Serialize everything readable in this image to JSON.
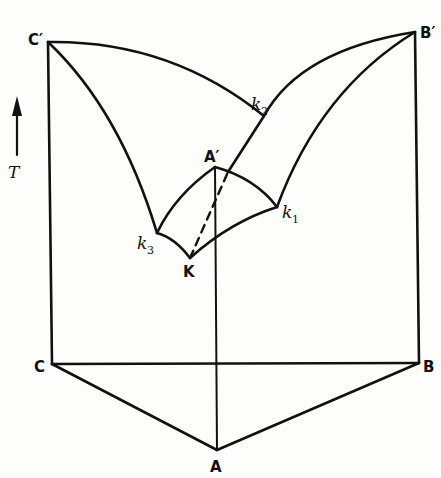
{
  "diagram": {
    "axis": {
      "label": "T",
      "arrow": "up"
    },
    "vertices": {
      "base": [
        {
          "id": "C",
          "label": "C",
          "x": 52,
          "y": 364
        },
        {
          "id": "B",
          "label": "B",
          "x": 419,
          "y": 363
        },
        {
          "id": "A",
          "label": "A",
          "x": 217,
          "y": 450
        }
      ],
      "top": [
        {
          "id": "Cp",
          "label": "C′",
          "x": 48,
          "y": 42
        },
        {
          "id": "Bp",
          "label": "B′",
          "x": 415,
          "y": 32
        },
        {
          "id": "Ap",
          "label": "A′",
          "x": 215,
          "y": 167
        }
      ]
    },
    "binary_eutectics": [
      {
        "id": "k1",
        "base": "k",
        "sub": "1",
        "x": 277,
        "y": 207
      },
      {
        "id": "k2",
        "base": "k",
        "sub": "2",
        "x": 264,
        "y": 116
      },
      {
        "id": "k3",
        "base": "k",
        "sub": "3",
        "x": 157,
        "y": 233
      }
    ],
    "ternary_eutectic": {
      "id": "K",
      "label": "K",
      "x": 190,
      "y": 258
    },
    "labels": {
      "C_prime": "C′",
      "B_prime": "B′",
      "A_prime": "A′",
      "C": "C",
      "B": "B",
      "A": "A",
      "K": "K",
      "k": "k",
      "k1_sub": "1",
      "k2_sub": "2",
      "k3_sub": "3",
      "T": "T"
    }
  }
}
